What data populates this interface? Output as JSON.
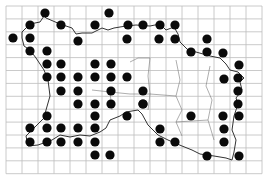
{
  "map": {
    "type": "distribution-grid-map",
    "grid": {
      "x0": 6,
      "y0": 6,
      "cols": 16,
      "rows": 13,
      "cell_w": 16,
      "cell_h": 12.9,
      "color": "#bdbdbd"
    },
    "outline_color": "#333333",
    "dot_color": "#0a0a0a",
    "dot_radius": 4.6,
    "dots": [
      [
        45,
        13
      ],
      [
        109,
        13
      ],
      [
        143,
        25
      ],
      [
        160,
        25
      ],
      [
        175,
        25
      ],
      [
        30,
        25
      ],
      [
        61,
        25
      ],
      [
        95,
        25
      ],
      [
        128,
        25
      ],
      [
        13,
        38
      ],
      [
        30,
        38
      ],
      [
        78,
        41
      ],
      [
        127,
        39
      ],
      [
        159,
        39
      ],
      [
        175,
        39
      ],
      [
        207,
        39
      ],
      [
        30,
        51
      ],
      [
        47,
        51
      ],
      [
        191,
        52
      ],
      [
        207,
        52
      ],
      [
        223,
        53
      ],
      [
        47,
        64
      ],
      [
        61,
        64
      ],
      [
        95,
        64
      ],
      [
        111,
        64
      ],
      [
        239,
        65
      ],
      [
        47,
        77
      ],
      [
        61,
        77
      ],
      [
        78,
        77
      ],
      [
        95,
        77
      ],
      [
        111,
        77
      ],
      [
        127,
        77
      ],
      [
        224,
        79
      ],
      [
        238,
        78
      ],
      [
        61,
        91
      ],
      [
        78,
        91
      ],
      [
        111,
        91
      ],
      [
        143,
        91
      ],
      [
        238,
        91
      ],
      [
        78,
        104
      ],
      [
        95,
        104
      ],
      [
        111,
        104
      ],
      [
        143,
        104
      ],
      [
        143,
        104
      ],
      [
        238,
        104
      ],
      [
        47,
        116
      ],
      [
        95,
        116
      ],
      [
        127,
        116
      ],
      [
        191,
        116
      ],
      [
        223,
        116
      ],
      [
        239,
        116
      ],
      [
        30,
        128
      ],
      [
        47,
        128
      ],
      [
        61,
        128
      ],
      [
        78,
        128
      ],
      [
        95,
        128
      ],
      [
        160,
        129
      ],
      [
        224,
        129
      ],
      [
        30,
        142
      ],
      [
        47,
        142
      ],
      [
        61,
        142
      ],
      [
        78,
        142
      ],
      [
        95,
        142
      ],
      [
        160,
        142
      ],
      [
        175,
        142
      ],
      [
        224,
        142
      ],
      [
        95,
        155
      ],
      [
        110,
        155
      ],
      [
        207,
        156
      ],
      [
        239,
        156
      ]
    ]
  }
}
